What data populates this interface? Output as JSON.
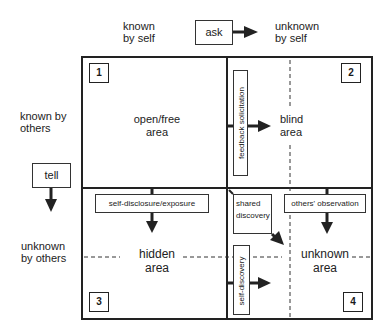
{
  "header": {
    "known_by_self": "known\nby self",
    "ask": "ask",
    "unknown_by_self": "unknown\nby self"
  },
  "side": {
    "known_by_others": "known by\nothers",
    "tell": "tell",
    "unknown_by_others": "unknown\nby others"
  },
  "quadrants": [
    {
      "number": "1",
      "label_line1": "open/free",
      "label_line2": "area"
    },
    {
      "number": "2",
      "label_line1": "blind",
      "label_line2": "area"
    },
    {
      "number": "3",
      "label_line1": "hidden",
      "label_line2": "area"
    },
    {
      "number": "4",
      "label_line1": "unknown",
      "label_line2": "area"
    }
  ],
  "processes": {
    "feedback_solicitation": "feedback solicitation",
    "self_disclosure": "self-disclosure/exposure",
    "shared_discovery_line1": "shared",
    "shared_discovery_line2": "discovery",
    "others_observation": "others' observation",
    "self_discovery": "self-discovery"
  },
  "colors": {
    "line": "#222222",
    "background": "#ffffff"
  }
}
